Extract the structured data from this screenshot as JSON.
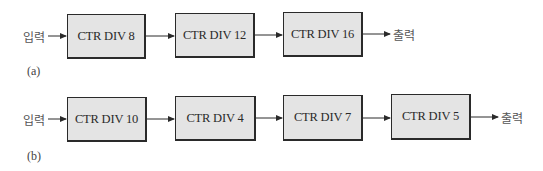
{
  "diagram_a": {
    "label": "(a)",
    "input_label": "입력",
    "output_label": "출력",
    "blocks": [
      {
        "label": "CTR DIV 8"
      },
      {
        "label": "CTR DIV 12"
      },
      {
        "label": "CTR DIV 16"
      }
    ]
  },
  "diagram_b": {
    "label": "(b)",
    "input_label": "입력",
    "output_label": "출력",
    "blocks": [
      {
        "label": "CTR DIV 10"
      },
      {
        "label": "CTR DIV 4"
      },
      {
        "label": "CTR DIV 7"
      },
      {
        "label": "CTR DIV 5"
      }
    ]
  }
}
